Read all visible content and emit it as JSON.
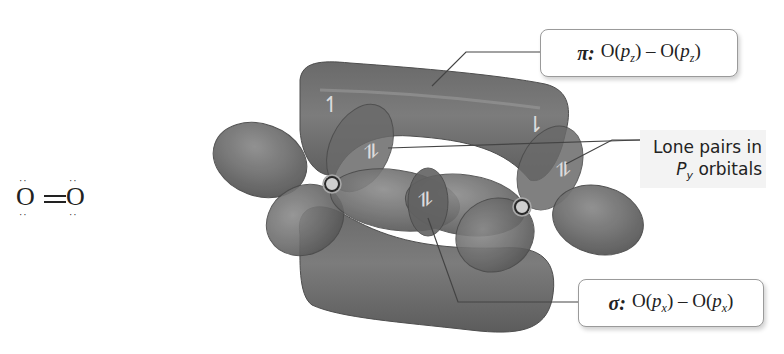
{
  "lewis_structure": {
    "formula": "O=O",
    "left_atom": "O",
    "right_atom": "O",
    "bond": "double",
    "lone_pair_dots_each_atom": 2
  },
  "labels": {
    "pi": {
      "symbol": "π",
      "separator": ":",
      "left_atom": "O",
      "left_orbital": "p",
      "left_sub": "z",
      "dash": "–",
      "right_atom": "O",
      "right_orbital": "p",
      "right_sub": "z"
    },
    "sigma": {
      "symbol": "σ",
      "separator": ":",
      "left_atom": "O",
      "left_orbital": "p",
      "left_sub": "x",
      "dash": "–",
      "right_atom": "O",
      "right_orbital": "p",
      "right_sub": "x"
    },
    "lone_pairs": {
      "line1": "Lone pairs in",
      "orbital": "P",
      "orbital_sub": "y",
      "line2_rest": " orbitals"
    }
  },
  "electron_arrows": {
    "pi_top_left": "↿",
    "pi_top_right": "⇂",
    "lone_pair_left": "⥮",
    "lone_pair_right": "⥮",
    "sigma_pair": "⥮"
  },
  "colors": {
    "lobe_fill": "#6e6e6e",
    "lobe_dark": "#555555",
    "lobe_highlight": "#8a8a8a",
    "nucleus_ring": "#b0b0b0",
    "leader_line": "#444444",
    "background": "#ffffff"
  }
}
